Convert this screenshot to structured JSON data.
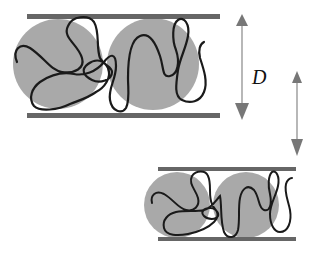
{
  "figure": {
    "label_D": "D",
    "colors": {
      "plate": "#666666",
      "particle": "#a9a9a9",
      "chain": "#1a1a1a",
      "arrow": "#777777",
      "background": "#ffffff"
    },
    "panels": [
      {
        "name": "wide-gap",
        "plate_separation_px": 99,
        "particle_count": 2
      },
      {
        "name": "narrow-gap",
        "plate_separation_px": 70,
        "particle_count": 2
      }
    ]
  }
}
